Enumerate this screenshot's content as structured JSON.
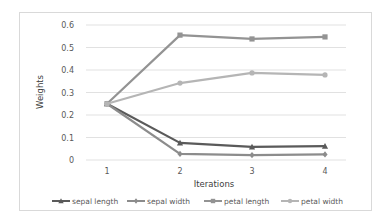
{
  "chart_data": {
    "type": "line",
    "title": "",
    "xlabel": "Iterations",
    "ylabel": "Weights",
    "x": [
      1,
      2,
      3,
      4
    ],
    "categories": [
      "1",
      "2",
      "3",
      "4"
    ],
    "ylim": [
      0,
      0.6
    ],
    "yticks": [
      0,
      0.1,
      0.2,
      0.3,
      0.4,
      0.5,
      0.6
    ],
    "ytick_labels": [
      "0",
      "0.1",
      "0.2",
      "0.3",
      "0.4",
      "0.5",
      "0.6"
    ],
    "grid": true,
    "legend_position": "bottom",
    "series": [
      {
        "name": "sepal length",
        "values": [
          0.25,
          0.076,
          0.058,
          0.062
        ],
        "color": "#5a5a5a",
        "marker": "triangle"
      },
      {
        "name": "sepal width",
        "values": [
          0.25,
          0.027,
          0.022,
          0.025
        ],
        "color": "#8c8c8c",
        "marker": "diamond"
      },
      {
        "name": "petal length",
        "values": [
          0.25,
          0.555,
          0.538,
          0.547
        ],
        "color": "#939393",
        "marker": "square"
      },
      {
        "name": "petal width",
        "values": [
          0.25,
          0.342,
          0.387,
          0.378
        ],
        "color": "#b5b5b5",
        "marker": "circle"
      }
    ]
  },
  "layout": {
    "plot_left": 86,
    "plot_right": 346,
    "x_px": [
      107,
      180,
      252,
      325
    ],
    "y_zero_px": 160,
    "y_top_px": 25
  }
}
